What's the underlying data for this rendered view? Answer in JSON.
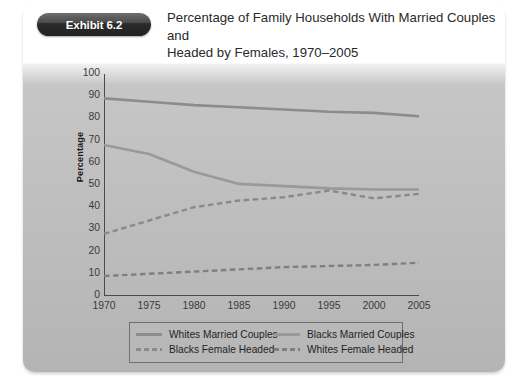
{
  "exhibit": {
    "badge_label": "Exhibit 6.2",
    "title_line1": "Percentage of Family Households With Married Couples and",
    "title_line2": "Headed by Females, 1970–2005"
  },
  "colors": {
    "panel_background": "#bdbdbd",
    "header_background": "#ffffff",
    "badge_background": "#222222",
    "axis": "#4a4a4a",
    "whites_married": "#8c8c8c",
    "blacks_married": "#999999",
    "blacks_female_headed": "#8a8a8a",
    "whites_female_headed": "#7f7f7f",
    "legend_border": "#6f6f6f"
  },
  "chart_data": {
    "type": "line",
    "title": "Percentage of Family Households With Married Couples and Headed by Females, 1970–2005",
    "xlabel": "",
    "ylabel": "Percentage",
    "x": [
      1970,
      1975,
      1980,
      1985,
      1990,
      1995,
      2000,
      2005
    ],
    "xtick_labels": [
      "1970",
      "1975",
      "1980",
      "1985",
      "1990",
      "1995",
      "2000",
      "2005"
    ],
    "xlim": [
      1970,
      2005
    ],
    "ylim": [
      0,
      100
    ],
    "ytick_labels": [
      "0",
      "10",
      "20",
      "30",
      "40",
      "50",
      "60",
      "70",
      "80",
      "90",
      "100"
    ],
    "yticks": [
      0,
      10,
      20,
      30,
      40,
      50,
      60,
      70,
      80,
      90,
      100
    ],
    "grid": false,
    "legend_position": "below-center",
    "series": [
      {
        "name": "Whites Married Couples",
        "style": "solid",
        "color": "#8c8c8c",
        "values": [
          89,
          87.5,
          86,
          85,
          84,
          83,
          82.5,
          81
        ]
      },
      {
        "name": "Blacks Married Couples",
        "style": "solid",
        "color": "#999999",
        "values": [
          68,
          64,
          56,
          50.5,
          49.5,
          48.5,
          48,
          48
        ]
      },
      {
        "name": "Blacks Female Headed",
        "style": "dashed",
        "color": "#8a8a8a",
        "values": [
          28,
          34,
          40,
          43,
          44.5,
          47.5,
          44,
          46
        ]
      },
      {
        "name": "Whites Female Headed",
        "style": "dashed",
        "color": "#7f7f7f",
        "values": [
          9,
          10,
          11,
          12,
          13,
          13.5,
          14,
          15
        ]
      }
    ]
  },
  "legend": {
    "items": [
      {
        "label": "Whites Married Couples",
        "style": "solid"
      },
      {
        "label": "Blacks Married Couples",
        "style": "solid"
      },
      {
        "label": "Blacks Female Headed",
        "style": "dashed"
      },
      {
        "label": "Whites Female Headed",
        "style": "dashed"
      }
    ]
  }
}
